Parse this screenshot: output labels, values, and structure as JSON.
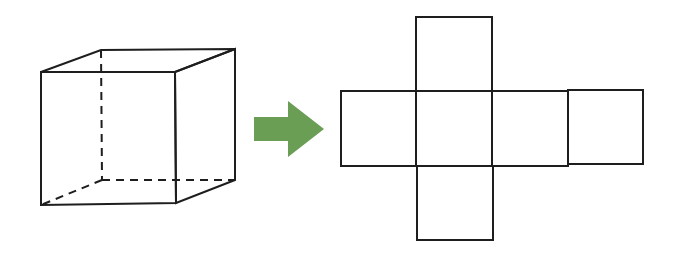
{
  "diagram": {
    "colors": {
      "line": "#1e1e1e",
      "arrow": "#6a9e55",
      "background": "#ffffff"
    },
    "cube": {
      "vertices": {
        "front_top_left": [
          41,
          72
        ],
        "front_top_right": [
          175,
          72
        ],
        "front_bottom_left": [
          41,
          205
        ],
        "front_bottom_right": [
          176,
          203
        ],
        "back_top_left": [
          101,
          50
        ],
        "back_top_right": [
          235,
          49
        ],
        "back_bottom_left": [
          102,
          180
        ],
        "back_bottom_right": [
          235,
          180
        ]
      },
      "hidden_edges": [
        "back_top_left-back_bottom_left",
        "back_bottom_left-back_bottom_right",
        "back_bottom_left-front_bottom_left"
      ]
    },
    "arrow": {
      "direction": "right",
      "icon": "right-arrow-icon"
    },
    "net": {
      "layout": "cross",
      "faces": [
        {
          "name": "top",
          "x": 416,
          "y": 17,
          "w": 76,
          "h": 74
        },
        {
          "name": "left",
          "x": 341,
          "y": 91,
          "w": 75,
          "h": 75
        },
        {
          "name": "front",
          "x": 416,
          "y": 91,
          "w": 76,
          "h": 75
        },
        {
          "name": "right",
          "x": 492,
          "y": 91,
          "w": 76,
          "h": 75
        },
        {
          "name": "back",
          "x": 568,
          "y": 90,
          "w": 75,
          "h": 74
        },
        {
          "name": "bottom",
          "x": 417,
          "y": 166,
          "w": 76,
          "h": 74
        }
      ]
    }
  }
}
